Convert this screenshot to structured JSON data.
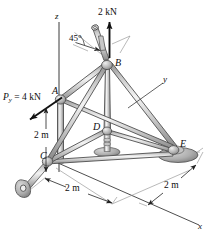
{
  "figure": {
    "type": "space-truss-free-body-diagram",
    "background_color": "#ffffff",
    "member_color": "#b9b9b9",
    "member_outline_color": "#4a4a4a",
    "support_color": "#9a9a9a",
    "line_color": "#1a1a1a"
  },
  "axes": [
    {
      "name": "z-axis",
      "label": "z"
    },
    {
      "name": "y-axis",
      "label": "y"
    },
    {
      "name": "x-axis",
      "label": "x"
    }
  ],
  "nodes": [
    {
      "name": "joint-a",
      "label": "A"
    },
    {
      "name": "joint-b",
      "label": "B"
    },
    {
      "name": "joint-c",
      "label": "C"
    },
    {
      "name": "joint-d",
      "label": "D"
    },
    {
      "name": "joint-e",
      "label": "E"
    }
  ],
  "forces": [
    {
      "name": "force-2kn-at-b",
      "label": "2 kN",
      "magnitude": 2,
      "unit": "kN",
      "direction": "vertical-up"
    },
    {
      "name": "force-py-at-a",
      "symbol": "P",
      "subscript": "y",
      "equals": " = ",
      "value": "4 kN",
      "label": "4 kN",
      "magnitude": 4,
      "unit": "kN",
      "direction": "negative-y"
    }
  ],
  "angles": [
    {
      "name": "angle-45-at-b",
      "label": "45°",
      "value": 45,
      "unit": "deg"
    }
  ],
  "dimensions": [
    {
      "name": "dim-vertical-2m",
      "label": "2 m",
      "value": 2,
      "unit": "m",
      "orientation": "vertical",
      "between": "A-C"
    },
    {
      "name": "dim-horizontal-2m",
      "label": "2 m",
      "value": 2,
      "unit": "m",
      "orientation": "depth",
      "between": "C-base"
    },
    {
      "name": "dim-right-2m",
      "label": "2 m",
      "value": 2,
      "unit": "m",
      "orientation": "depth",
      "between": "E-base"
    }
  ],
  "supports": [
    {
      "name": "support-pin-lower-left",
      "type": "clevis-plate"
    },
    {
      "name": "support-base-d",
      "type": "post-base"
    },
    {
      "name": "support-base-e",
      "type": "ball-socket-pad"
    },
    {
      "name": "support-collar-b",
      "type": "sleeve-45deg"
    }
  ]
}
